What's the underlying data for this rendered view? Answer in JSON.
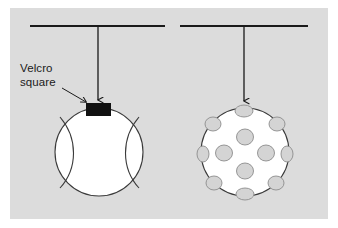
{
  "figure": {
    "background_color": "#ffffff",
    "panel_color": "#dcdcdc",
    "panel": {
      "x": 10,
      "y": 8,
      "width": 318,
      "height": 211
    },
    "ink_color": "#1a1a1a",
    "hole_fill_color": "#d4d4d4",
    "hole_stroke_color": "#8c8c8c",
    "ball_fill_color": "#ffffff",
    "velcro_color": "#111111"
  },
  "annotation": {
    "label_line_1": "Velcro",
    "label_line_2": "square",
    "label_x": 20,
    "label_y1": 72,
    "label_y2": 86,
    "leader": {
      "x1": 62,
      "y1": 88,
      "x2": 88,
      "y2": 103
    }
  },
  "assemblies": [
    {
      "id": "left",
      "name": "tennis-ball-assembly",
      "support_bar": {
        "x1": 30,
        "y1": 26,
        "x2": 165,
        "y2": 26
      },
      "string": {
        "x1": 98,
        "y1": 26,
        "x2": 98,
        "y2": 104
      },
      "arrow_tip": {
        "x": 98,
        "y": 104
      },
      "ball": {
        "cx": 99,
        "cy": 152,
        "r": 44,
        "type": "tennis"
      },
      "velcro_square": {
        "x": 86,
        "y": 103,
        "width": 25,
        "height": 13
      },
      "seams": [
        {
          "d": "M 60 117 C 78 138, 78 168, 60 188"
        },
        {
          "d": "M 139 117 C 121 138, 121 168, 139 188"
        }
      ]
    },
    {
      "id": "right",
      "name": "wiffle-ball-assembly",
      "support_bar": {
        "x1": 180,
        "y1": 26,
        "x2": 308,
        "y2": 26
      },
      "string": {
        "x1": 244,
        "y1": 26,
        "x2": 244,
        "y2": 105
      },
      "arrow_tip": {
        "x": 244,
        "y": 105
      },
      "ball": {
        "cx": 245,
        "cy": 152,
        "r": 44,
        "type": "wiffle"
      },
      "holes": [
        {
          "cx": 244,
          "cy": 111,
          "rx": 9,
          "ry": 6
        },
        {
          "cx": 213,
          "cy": 124,
          "rx": 8,
          "ry": 7
        },
        {
          "cx": 277,
          "cy": 124,
          "rx": 8,
          "ry": 7
        },
        {
          "cx": 245,
          "cy": 137,
          "rx": 8.5,
          "ry": 8
        },
        {
          "cx": 203,
          "cy": 154,
          "rx": 6,
          "ry": 8
        },
        {
          "cx": 287,
          "cy": 154,
          "rx": 6,
          "ry": 8
        },
        {
          "cx": 224,
          "cy": 153,
          "rx": 8.5,
          "ry": 8
        },
        {
          "cx": 266,
          "cy": 153,
          "rx": 8.5,
          "ry": 8
        },
        {
          "cx": 245,
          "cy": 171,
          "rx": 8.5,
          "ry": 8
        },
        {
          "cx": 214,
          "cy": 183,
          "rx": 8,
          "ry": 7
        },
        {
          "cx": 276,
          "cy": 183,
          "rx": 8,
          "ry": 7
        },
        {
          "cx": 245,
          "cy": 194,
          "rx": 9,
          "ry": 6
        }
      ]
    }
  ]
}
